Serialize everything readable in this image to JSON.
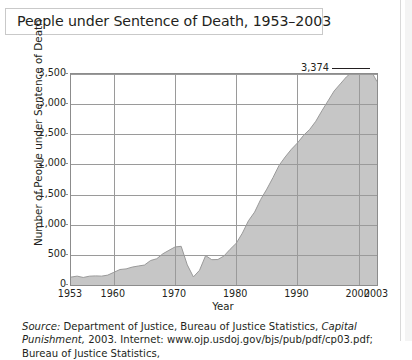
{
  "title": "People under Sentence of Death, 1953–2003",
  "axes": {
    "ylabel": "Number of People under Sentence of Death",
    "xlabel": "Year",
    "yticks": [
      "0",
      "500",
      "1,000",
      "1,500",
      "2,000",
      "2,500",
      "3,000",
      "3,500"
    ],
    "xticks": [
      "1953",
      "1960",
      "1970",
      "1980",
      "1990",
      "2000",
      "2003"
    ]
  },
  "annotation": {
    "label": "3,374"
  },
  "source": {
    "prefix": "Source:",
    "body": "Department of Justice, Bureau of Justice Statistics,",
    "italic_title": "Capital Punishment,",
    "line2": "2003. Internet: www.ojp.usdoj.gov/bjs/pub/pdf/cp03.pdf; Bureau of Justice Statistics,"
  },
  "colors": {
    "area_fill": "#c6c6c6",
    "area_stroke": "#9a9a9a",
    "grid": "#9a9a9a",
    "frame": "#8c8c8c",
    "text": "#231f20",
    "title_border": "#c9c9c9"
  },
  "chart_data": {
    "type": "area",
    "title": "People under Sentence of Death, 1953–2003",
    "xlabel": "Year",
    "ylabel": "Number of People under Sentence of Death",
    "xlim": [
      1953,
      2003
    ],
    "ylim": [
      0,
      3500
    ],
    "ytick_values": [
      0,
      500,
      1000,
      1500,
      2000,
      2500,
      3000,
      3500
    ],
    "xtick_values": [
      1953,
      1960,
      1970,
      1980,
      1990,
      2000,
      2003
    ],
    "grid": "both",
    "legend": "none",
    "annotations": [
      {
        "x": 2003,
        "y": 3374,
        "label": "3,374"
      }
    ],
    "x": [
      1953,
      1954,
      1955,
      1956,
      1957,
      1958,
      1959,
      1960,
      1961,
      1962,
      1963,
      1964,
      1965,
      1966,
      1967,
      1968,
      1969,
      1970,
      1971,
      1972,
      1973,
      1974,
      1975,
      1976,
      1977,
      1978,
      1979,
      1980,
      1981,
      1982,
      1983,
      1984,
      1985,
      1986,
      1987,
      1988,
      1989,
      1990,
      1991,
      1992,
      1993,
      1994,
      1995,
      1996,
      1997,
      1998,
      1999,
      2000,
      2001,
      2002,
      2003
    ],
    "values": [
      131,
      147,
      125,
      146,
      151,
      147,
      164,
      210,
      257,
      267,
      297,
      315,
      331,
      406,
      435,
      517,
      575,
      631,
      642,
      334,
      134,
      244,
      488,
      420,
      423,
      482,
      593,
      692,
      860,
      1066,
      1209,
      1420,
      1591,
      1781,
      1984,
      2124,
      2250,
      2356,
      2482,
      2580,
      2716,
      2890,
      3054,
      3219,
      3335,
      3452,
      3540,
      3593,
      3577,
      3557,
      3374
    ]
  }
}
